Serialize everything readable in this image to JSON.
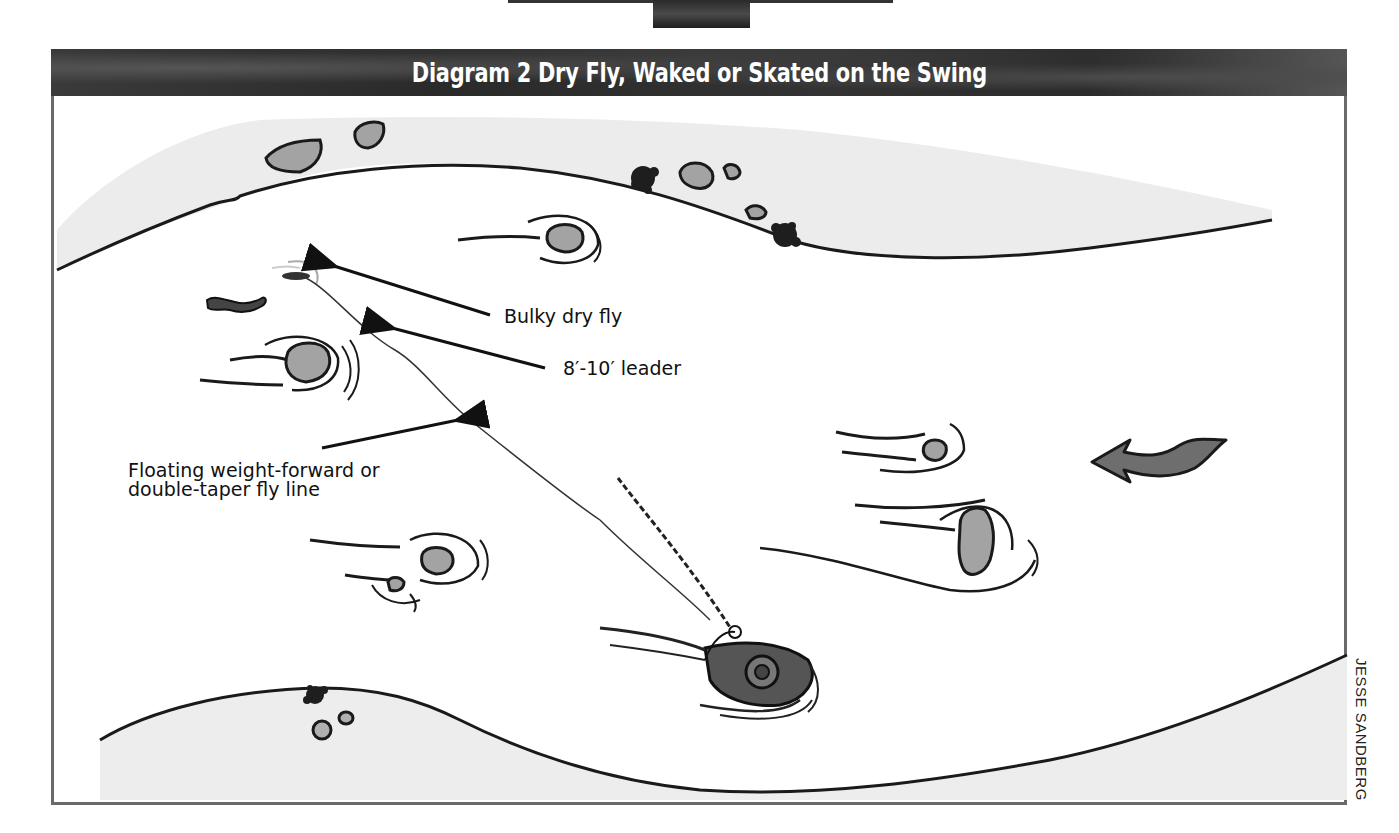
{
  "diagram": {
    "title": "Diagram 2 Dry Fly, Waked or Skated on the Swing",
    "labels": {
      "bulky_dry_fly": "Bulky dry fly",
      "leader": "8′-10′ leader",
      "fly_line_line1": "Floating weight-forward or",
      "fly_line_line2": "double-taper fly line"
    },
    "credit": "JESSE SANDBERG",
    "elements": [
      "river-banks",
      "rocks",
      "current-seams",
      "angler-in-water",
      "fly-rod",
      "fly-line",
      "leader",
      "dry-fly",
      "fish",
      "current-direction-arrow",
      "vegetation-clumps"
    ],
    "colors": {
      "title_bar": "#333333",
      "frame_border": "#6a6a6a",
      "ink": "#1a1a1a",
      "rock_fill": "#9a9a9a",
      "bank_shading": "#e6e6e6",
      "arrow_fill": "#6e6e6e"
    }
  }
}
